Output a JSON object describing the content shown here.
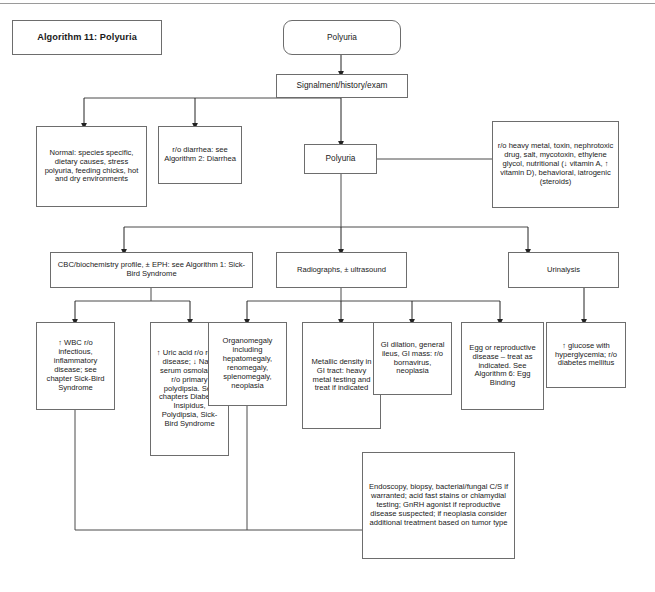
{
  "page": {
    "title_box": "Algorithm 11: Polyuria",
    "top_rule": true,
    "line_color": "#6d6d6d",
    "text_color": "#1a1a1a",
    "background": "#ffffff"
  },
  "nodes": {
    "start": "Polyuria",
    "signalment": "Signalment/history/exam",
    "normal": "Normal: species specific, dietary causes, stress polyuria, feeding chicks, hot and dry environments",
    "diarrhea": "r/o diarrhea: see Algorithm 2: Diarrhea",
    "polyuria2": "Polyuria",
    "ruleouts": "r/o heavy metal, toxin, nephrotoxic drug, salt, mycotoxin, ethylene glycol, nutritional (↓ vitamin A, ↑ vitamin D), behavioral, iatrogenic (steroids)",
    "cbc": "CBC/biochemistry profile, ± EPH: see Algorithm 1: Sick-Bird Syndrome",
    "radiographs": "Radiographs, ± ultrasound",
    "urinalysis": "Urinalysis",
    "wbc": "↑ WBC r/o infectious, inflammatory disease; see chapter Sick-Bird Syndrome",
    "uric_acid": "↑ Uric acid r/o renal disease; ↓ Na, ↓ serum osmolality: r/o primary polydipsia. See chapters Diabetes Insipidus, Polydipsia, Sick-Bird Syndrome",
    "organomegaly": "Organomegaly including hepatomegaly, renomegaly, splenomegaly, neoplasia",
    "metallic": "Metallic density in GI tract: heavy metal testing and treat if indicated",
    "gi_dilation": "GI dilation, general ileus, GI mass: r/o bornavirus, neoplasia",
    "egg": "Egg or reproductive disease – treat as indicated. See Algorithm 6: Egg Binding",
    "glucose": "↑ glucose with hyperglycemia; r/o diabetes mellitus",
    "endoscopy": "Endoscopy, biopsy, bacterial/fungal C/S if warranted; acid fast stains or chlamydial testing; GnRH agonist if reproductive disease suspected; if neoplasia consider additional treatment based on tumor type"
  }
}
